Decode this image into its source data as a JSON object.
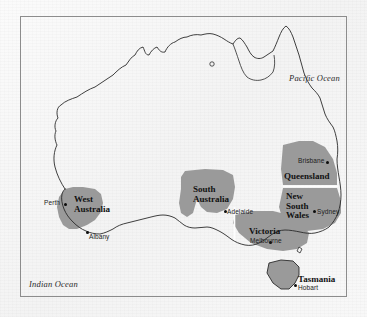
{
  "map": {
    "title": "Map of Australia with highlighted states",
    "background_color": "#f6f6f6",
    "frame_color": "#8c8c8c",
    "coast_color": "#2a2a2a",
    "highlight_fill": "#9a9a9a",
    "border_line_color": "#ffffff",
    "ocean_labels": [
      {
        "name": "pacific-ocean",
        "text": "Pacific Ocean",
        "x": 268,
        "y": 62
      },
      {
        "name": "indian-ocean",
        "text": "Indian Ocean",
        "x": 28,
        "y": 268
      }
    ],
    "states": [
      {
        "name": "west-australia",
        "label": "West\nAustralia",
        "line1": "West",
        "line2": "Australia",
        "x": 73,
        "y": 192
      },
      {
        "name": "south-australia",
        "label": "South\nAustralia",
        "line1": "South",
        "line2": "Australia",
        "x": 192,
        "y": 182
      },
      {
        "name": "queensland",
        "label": "Queensland",
        "line1": "Queensland",
        "line2": "",
        "x": 283,
        "y": 168
      },
      {
        "name": "new-south-wales",
        "label": "New\nSouth\nWales",
        "line1": "New",
        "line2": "South",
        "line3": "Wales",
        "x": 285,
        "y": 192
      },
      {
        "name": "victoria",
        "label": "Victoria",
        "line1": "Victoria",
        "line2": "",
        "x": 248,
        "y": 226
      },
      {
        "name": "tasmania",
        "label": "Tasmania",
        "line1": "Tasmania",
        "line2": "",
        "x": 297,
        "y": 274
      }
    ],
    "cities": [
      {
        "name": "perth",
        "text": "Perth",
        "label_x": 43,
        "label_y": 200,
        "dot_x": 63,
        "dot_y": 202
      },
      {
        "name": "albany",
        "text": "Albany",
        "label_x": 88,
        "label_y": 233,
        "dot_x": 85,
        "dot_y": 230
      },
      {
        "name": "adelaide",
        "text": "Adelaide",
        "label_x": 226,
        "label_y": 211,
        "dot_x": 223,
        "dot_y": 209
      },
      {
        "name": "melbourne",
        "text": "Melbourne",
        "label_x": 250,
        "label_y": 235,
        "dot_x": 268,
        "dot_y": 240
      },
      {
        "name": "sydney",
        "text": "Sydney",
        "label_x": 316,
        "label_y": 211,
        "dot_x": 312,
        "dot_y": 209
      },
      {
        "name": "brisbane",
        "text": "Brisbane",
        "label_x": 292,
        "label_y": 157,
        "dot_x": 325,
        "dot_y": 160
      },
      {
        "name": "hobart",
        "text": "Hobart",
        "label_x": 297,
        "label_y": 285,
        "dot_x": 293,
        "dot_y": 283
      }
    ]
  }
}
